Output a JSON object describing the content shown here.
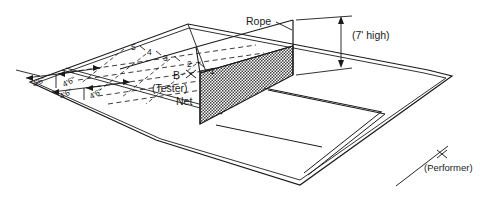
{
  "diagram": {
    "title_visible": false,
    "background_color": "#ffffff",
    "line_color": "#1a1a1a",
    "net_fill_color": "#4a4a4a",
    "labels": {
      "rope": "Rope",
      "height": "(7' high)",
      "tester_mark": "B",
      "tester": "(Tester)",
      "net": "Net",
      "performer": "(Performer)"
    },
    "target_lane_numbers": [
      "5",
      "4",
      "3",
      "2",
      "1"
    ],
    "width_dimensions": [
      "4'6\"",
      "4'6\"",
      "4'6\"",
      "4'6\""
    ]
  }
}
